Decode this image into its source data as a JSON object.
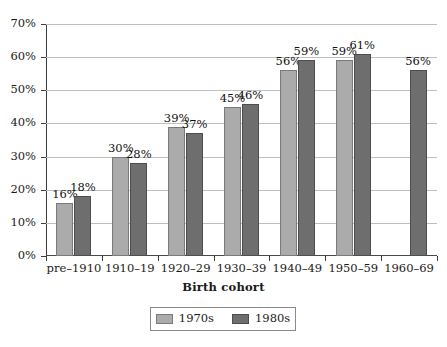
{
  "chart_data": {
    "type": "bar",
    "title": "",
    "xlabel": "Birth cohort",
    "ylabel": "",
    "ylim": [
      0,
      70
    ],
    "ytick_labels": [
      "0%",
      "10%",
      "20%",
      "30%",
      "40%",
      "50%",
      "60%",
      "70%"
    ],
    "ytick_values": [
      0,
      10,
      20,
      30,
      40,
      50,
      60,
      70
    ],
    "grid": "horizontal",
    "legend_position": "bottom-center",
    "value_suffix": "%",
    "categories": [
      "pre–1910",
      "1910–19",
      "1920–29",
      "1930–39",
      "1940–49",
      "1950–59",
      "1960–69"
    ],
    "series": [
      {
        "name": "1970s",
        "color": "#ababab",
        "border": "#7a7a7a",
        "values": [
          16,
          30,
          39,
          45,
          56,
          59,
          null
        ],
        "labels": [
          "16%",
          "30%",
          "39%",
          "45%",
          "56%",
          "59%",
          ""
        ]
      },
      {
        "name": "1980s",
        "color": "#6e6e6e",
        "border": "#4d4d4d",
        "values": [
          18,
          28,
          37,
          46,
          59,
          61,
          56
        ],
        "labels": [
          "18%",
          "28%",
          "37%",
          "46%",
          "59%",
          "61%",
          "56%"
        ]
      }
    ]
  },
  "legend": {
    "items": [
      {
        "label": "1970s"
      },
      {
        "label": "1980s"
      }
    ]
  },
  "axis": {
    "x_title": "Birth cohort"
  }
}
